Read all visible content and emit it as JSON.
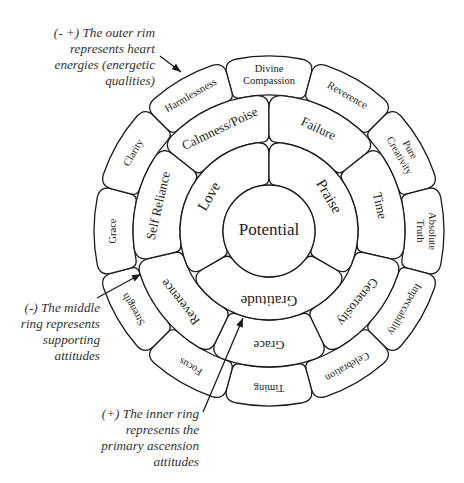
{
  "diagram": {
    "center": {
      "x": 269,
      "y": 231
    },
    "colors": {
      "stroke": "#1a1a1a",
      "fill": "#ffffff",
      "text": "#222222",
      "annotation_text": "#333333"
    },
    "center_circle": {
      "label": "Potential",
      "radius": 46
    },
    "inner_ring": {
      "r_inner": 46,
      "r_outer": 89,
      "segments": [
        {
          "label": "Love",
          "angle": -60
        },
        {
          "label": "Praise",
          "angle": 60
        },
        {
          "label": "Gratitude",
          "angle": 180
        }
      ]
    },
    "middle_ring": {
      "r_inner": 89,
      "r_outer": 136,
      "segments": [
        {
          "label": "Calmness/Poise",
          "angle": -25.7
        },
        {
          "label": "Failure",
          "angle": 25.7
        },
        {
          "label": "Time",
          "angle": 77.1
        },
        {
          "label": "Generosity",
          "angle": 128.6
        },
        {
          "label": "Grace",
          "angle": 180
        },
        {
          "label": "Reverence",
          "angle": 231.4
        },
        {
          "label": "Self Reliance",
          "angle": 282.9
        }
      ]
    },
    "outer_rim": {
      "r_inner": 136,
      "r_outer": 175,
      "segments": [
        {
          "label": "Divine Compassion",
          "lines": [
            "Divine",
            "Compassion"
          ],
          "angle": 0
        },
        {
          "label": "Reverence",
          "lines": [
            "Reverence"
          ],
          "angle": 30
        },
        {
          "label": "Pure Creativity",
          "lines": [
            "Pure",
            "Creativity"
          ],
          "angle": 60
        },
        {
          "label": "Absolute Truth",
          "lines": [
            "Absolute",
            "Truth"
          ],
          "angle": 90
        },
        {
          "label": "Impeccability",
          "lines": [
            "Impeccability"
          ],
          "angle": 120
        },
        {
          "label": "Celebration",
          "lines": [
            "Celebration"
          ],
          "angle": 150
        },
        {
          "label": "Timing",
          "lines": [
            "Timing"
          ],
          "angle": 180
        },
        {
          "label": "Focus",
          "lines": [
            "Focus"
          ],
          "angle": 210
        },
        {
          "label": "Strength",
          "lines": [
            "Strength"
          ],
          "angle": 240
        },
        {
          "label": "Grace",
          "lines": [
            "Grace"
          ],
          "angle": 270
        },
        {
          "label": "Clarity",
          "lines": [
            "Clarity"
          ],
          "angle": 300
        },
        {
          "label": "Harmlessness",
          "lines": [
            "Harmlessness"
          ],
          "angle": 330
        }
      ]
    }
  },
  "annotations": {
    "outer_rim": {
      "lines": [
        "(- +) The outer rim",
        "represents heart",
        "energies (energetic",
        "qualities)"
      ],
      "arrow": {
        "from": [
          160,
          56
        ],
        "to": [
          181,
          72
        ]
      }
    },
    "middle_ring": {
      "lines": [
        "(-) The middle",
        "ring represents",
        "supporting",
        "attitudes"
      ],
      "arrow": {
        "from": [
          97,
          298
        ],
        "to": [
          141,
          274
        ]
      }
    },
    "inner_ring": {
      "lines": [
        "(+)  The inner ring",
        "represents the",
        "primary ascension",
        "attitudes"
      ],
      "arrow": {
        "from": [
          203,
          412
        ],
        "to": [
          243,
          318
        ]
      }
    }
  }
}
